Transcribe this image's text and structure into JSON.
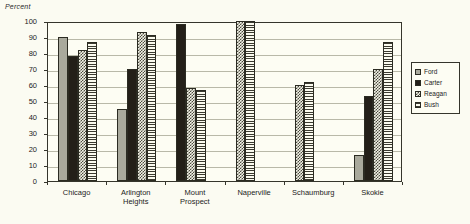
{
  "chart_data": {
    "type": "bar",
    "title": "",
    "subtitle": "",
    "xlabel": "",
    "ylabel": "Percent",
    "ylim": [
      0,
      100
    ],
    "y_ticks": [
      0,
      10,
      20,
      30,
      40,
      50,
      60,
      70,
      80,
      90,
      100
    ],
    "y_tick_labels": [
      "0",
      "10",
      "20",
      "30",
      "40",
      "50",
      "60",
      "70",
      "80",
      "90",
      "100"
    ],
    "grid": true,
    "legend_position": "right",
    "categories": [
      "Chicago",
      "Arlington\nHeights",
      "Mount\nProspect",
      "Naperville",
      "Schaumburg",
      "Skokie"
    ],
    "series": [
      {
        "name": "Ford",
        "pattern": "solid-gray",
        "color": "#a9a99c",
        "values": [
          90,
          45,
          null,
          null,
          null,
          16
        ]
      },
      {
        "name": "Carter",
        "pattern": "solid-black",
        "color": "#231f18",
        "values": [
          78,
          70,
          98,
          null,
          null,
          53
        ]
      },
      {
        "name": "Reagan",
        "pattern": "checker",
        "color": "#4b4a3e",
        "values": [
          82,
          93,
          58,
          100,
          60,
          70
        ]
      },
      {
        "name": "Bush",
        "pattern": "hstripe",
        "color": "#3b3a30",
        "values": [
          87,
          91,
          57,
          100,
          62,
          87
        ]
      }
    ]
  },
  "legend": {
    "items": [
      {
        "label": "Ford"
      },
      {
        "label": "Carter"
      },
      {
        "label": "Reagan"
      },
      {
        "label": "Bush"
      }
    ]
  },
  "colors": {
    "background": "#fbfbf2",
    "plot_background": "#fdfdf3",
    "axis": "#35352c",
    "gridline": "#b9b9a8",
    "text": "#1c1c1c"
  }
}
